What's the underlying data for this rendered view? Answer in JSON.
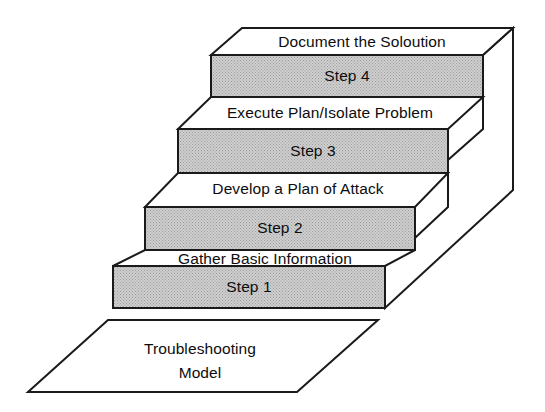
{
  "diagram": {
    "type": "3d-staircase",
    "colors": {
      "riser_fill": "#c4c4c4",
      "tread_fill": "#ffffff",
      "outline": "#1a1a1a",
      "background": "#ffffff",
      "text": "#0d0d0d"
    },
    "base": {
      "line1": "Troubleshooting",
      "line2": "Model"
    },
    "steps": [
      {
        "riser_label": "Step 1",
        "tread_label": "Gather Basic Information"
      },
      {
        "riser_label": "Step 2",
        "tread_label": "Develop a Plan of Attack"
      },
      {
        "riser_label": "Step 3",
        "tread_label": "Execute Plan/Isolate Problem"
      },
      {
        "riser_label": "Step 4",
        "tread_label": "Document the Soloution"
      }
    ]
  }
}
